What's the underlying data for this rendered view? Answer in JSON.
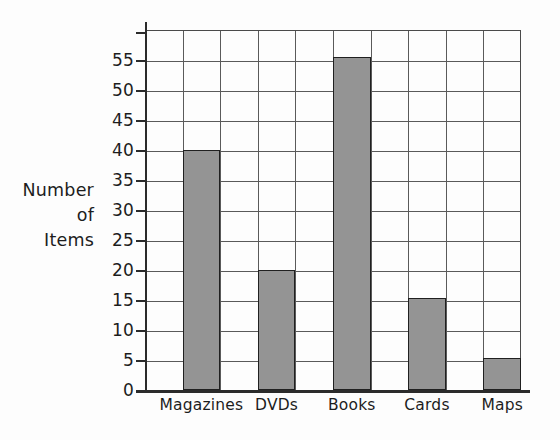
{
  "chart_data": {
    "type": "bar",
    "title": "",
    "xlabel": "",
    "ylabel": "Number of Items",
    "ylabel_lines": [
      "Number",
      "of",
      "Items"
    ],
    "categories": [
      "Magazines",
      "DVDs",
      "Books",
      "Cards",
      "Maps"
    ],
    "values": [
      40,
      20,
      55.5,
      15.3,
      5.4
    ],
    "ylim": [
      0,
      60
    ],
    "y_ticks": [
      0,
      5,
      10,
      15,
      20,
      25,
      30,
      35,
      40,
      45,
      50,
      55
    ],
    "y_tick_labels": [
      "0",
      "5",
      "10",
      "15",
      "20",
      "25",
      "30",
      "35",
      "40",
      "45",
      "50",
      "55"
    ],
    "grid": "both",
    "vertical_gridlines": 10,
    "legend": "none",
    "colors": {
      "bar_fill": "#949494",
      "bar_edge": "#202020",
      "gridline": "#5a5a5a",
      "axis": "#2b2b2b",
      "text": "#1d1d1d",
      "background": "#fdfdfd"
    }
  }
}
